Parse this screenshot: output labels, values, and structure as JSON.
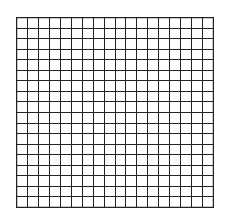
{
  "grid": {
    "columns": 18,
    "rows": 18,
    "line_color": "#222222",
    "background": "#ffffff"
  }
}
